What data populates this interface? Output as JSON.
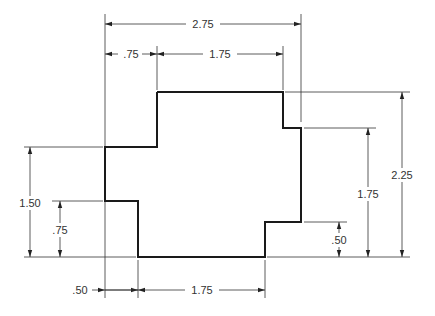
{
  "drawing": {
    "title": "Stepped profile dimensioned drawing",
    "colors": {
      "outline": "#1a1a1a",
      "dimension": "#333333",
      "background": "#ffffff"
    },
    "outline_points": [
      [
        157,
        92
      ],
      [
        283,
        92
      ],
      [
        283,
        128
      ],
      [
        301,
        128
      ],
      [
        301,
        222
      ],
      [
        265,
        222
      ],
      [
        265,
        257
      ],
      [
        138,
        257
      ],
      [
        138,
        201
      ],
      [
        105,
        201
      ],
      [
        105,
        147
      ],
      [
        157,
        147
      ]
    ],
    "dimensions": {
      "top_overall": {
        "label": "2.75",
        "x1": 105,
        "x2": 301,
        "y": 24
      },
      "top_left": {
        "label": ".75",
        "x1": 105,
        "x2": 157,
        "y": 54
      },
      "top_right": {
        "label": "1.75",
        "x1": 157,
        "x2": 283,
        "y": 54
      },
      "left_outer": {
        "label": "1.50",
        "y1": 147,
        "y2": 257,
        "x": 30
      },
      "left_inner": {
        "label": ".75",
        "y1": 201,
        "y2": 257,
        "x": 60
      },
      "right_small": {
        "label": ".50",
        "y1": 222,
        "y2": 257,
        "x": 339
      },
      "right_mid": {
        "label": "1.75",
        "y1": 128,
        "y2": 257,
        "x": 368
      },
      "right_overall": {
        "label": "2.25",
        "y1": 92,
        "y2": 257,
        "x": 402
      },
      "bottom_left": {
        "label": ".50",
        "x1": 105,
        "x2": 138,
        "y": 290
      },
      "bottom_right": {
        "label": "1.75",
        "x1": 138,
        "x2": 265,
        "y": 290
      }
    }
  }
}
